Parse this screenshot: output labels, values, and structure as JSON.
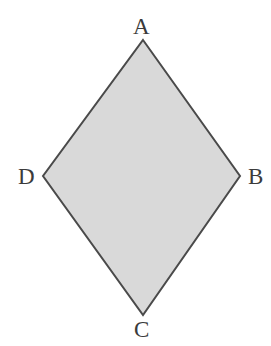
{
  "figure": {
    "shape_name": "rhombus",
    "width": 271,
    "height": 346,
    "background_color": "#ffffff",
    "fill_color": "#d9d9d9",
    "stroke_color": "#4a4a4a",
    "stroke_width": 2,
    "label_color": "#3b3b3b",
    "polygon_points": "143,40 240,176 143,315 43,176",
    "vertices": [
      {
        "id": "A",
        "label": "A",
        "x": 143,
        "y": 40,
        "position": "top"
      },
      {
        "id": "B",
        "label": "B",
        "x": 240,
        "y": 176,
        "position": "right"
      },
      {
        "id": "C",
        "label": "C",
        "x": 143,
        "y": 315,
        "position": "bottom"
      },
      {
        "id": "D",
        "label": "D",
        "x": 43,
        "y": 176,
        "position": "left"
      }
    ]
  }
}
